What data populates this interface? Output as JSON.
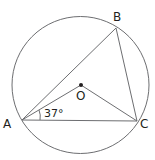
{
  "diagram": {
    "type": "circle-geometry",
    "circle": {
      "cx": 80.5,
      "cy": 85,
      "r": 68.5,
      "stroke": "#6d6e71"
    },
    "points": {
      "A": {
        "label": "A",
        "x": 22,
        "y": 120,
        "label_x": 3,
        "label_y": 128
      },
      "B": {
        "label": "B",
        "x": 116,
        "y": 28,
        "label_x": 113,
        "label_y": 21
      },
      "C": {
        "label": "C",
        "x": 137,
        "y": 121,
        "label_x": 140,
        "label_y": 128
      },
      "O": {
        "label": "O",
        "x": 81,
        "y": 85,
        "label_x": 77,
        "label_y": 99
      }
    },
    "angle_label": {
      "text": "37°",
      "x": 45,
      "y": 118
    },
    "line_color": "#6d6e71",
    "text_color": "#231f20"
  }
}
